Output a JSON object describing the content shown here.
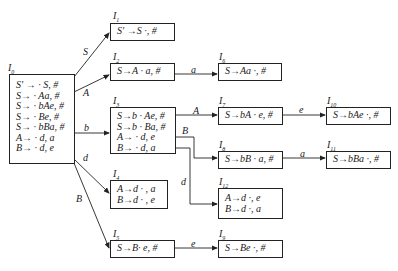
{
  "diagram": {
    "type": "LR(1) item-set DFA",
    "states": [
      {
        "id": "I0",
        "label": "I",
        "index": "0",
        "items": [
          "S' → · S, #",
          "S→ · Aa, #",
          "S→ · bAe, #",
          "S→ · Be, #",
          "S→ · bBa, #",
          "A→ · d, a",
          "B→ · d, e"
        ]
      },
      {
        "id": "I1",
        "label": "I",
        "index": "1",
        "items": [
          "S' →S ·, #"
        ]
      },
      {
        "id": "I2",
        "label": "I",
        "index": "2",
        "items": [
          "S→A · a, #"
        ]
      },
      {
        "id": "I3",
        "label": "I",
        "index": "3",
        "items": [
          "S→b · Ae, #",
          "S→b · Ba, #",
          "A→ · d, e",
          "B→ · d, a"
        ]
      },
      {
        "id": "I4",
        "label": "I",
        "index": "4",
        "items": [
          "A→d · , a",
          "B→d · , e"
        ]
      },
      {
        "id": "I5",
        "label": "I",
        "index": "5",
        "items": [
          "S→B· e, #"
        ]
      },
      {
        "id": "I6",
        "label": "I",
        "index": "6",
        "items": [
          "S→Aa ·, #"
        ]
      },
      {
        "id": "I7",
        "label": "I",
        "index": "7",
        "items": [
          "S→bA · e, #"
        ]
      },
      {
        "id": "I8",
        "label": "I",
        "index": "8",
        "items": [
          "S→bB · a, #"
        ]
      },
      {
        "id": "I9",
        "label": "I",
        "index": "9",
        "items": [
          "S→Be ·, #"
        ]
      },
      {
        "id": "I10",
        "label": "I",
        "index": "10",
        "items": [
          "S→bAe ·, #"
        ]
      },
      {
        "id": "I11",
        "label": "I",
        "index": "11",
        "items": [
          "S→bBa ·, #"
        ]
      },
      {
        "id": "I12",
        "label": "I",
        "index": "12",
        "items": [
          "A→d ·, e",
          "B→d ·, a"
        ]
      }
    ],
    "edges": [
      {
        "from": "I0",
        "to": "I1",
        "symbol": "S"
      },
      {
        "from": "I0",
        "to": "I2",
        "symbol": "A"
      },
      {
        "from": "I0",
        "to": "I3",
        "symbol": "b"
      },
      {
        "from": "I0",
        "to": "I4",
        "symbol": "d"
      },
      {
        "from": "I0",
        "to": "I5",
        "symbol": "B"
      },
      {
        "from": "I2",
        "to": "I6",
        "symbol": "a"
      },
      {
        "from": "I3",
        "to": "I7",
        "symbol": "A"
      },
      {
        "from": "I3",
        "to": "I8",
        "symbol": "B"
      },
      {
        "from": "I3",
        "to": "I12",
        "symbol": "d"
      },
      {
        "from": "I7",
        "to": "I10",
        "symbol": "e"
      },
      {
        "from": "I8",
        "to": "I11",
        "symbol": "a"
      },
      {
        "from": "I5",
        "to": "I9",
        "symbol": "e"
      }
    ]
  }
}
